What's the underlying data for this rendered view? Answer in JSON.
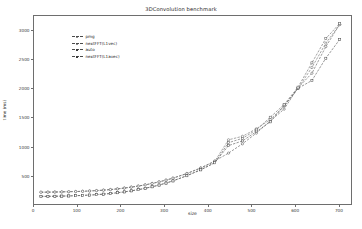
{
  "chart_data": {
    "type": "line",
    "title": "3DConvolution benchmark",
    "xlabel": "size",
    "ylabel": "time (ms)",
    "xlim": [
      0,
      730
    ],
    "ylim": [
      0,
      3250
    ],
    "xticks": [
      0,
      100,
      200,
      300,
      400,
      500,
      600,
      700
    ],
    "yticks": [
      500,
      1000,
      1500,
      2000,
      2500,
      3000
    ],
    "grid": false,
    "legend_position": "upper left",
    "x": [
      16,
      32,
      48,
      64,
      80,
      96,
      112,
      128,
      144,
      160,
      176,
      192,
      208,
      224,
      240,
      256,
      272,
      288,
      304,
      320,
      352,
      384,
      416,
      448,
      480,
      512,
      544,
      576,
      608,
      640,
      672,
      704
    ],
    "series": [
      {
        "name": "pmg",
        "marker": "circle",
        "linestyle": "dashed",
        "color": "#4a4a4a",
        "values": [
          205,
          206,
          208,
          210,
          213,
          216,
          220,
          226,
          232,
          240,
          250,
          262,
          276,
          292,
          310,
          332,
          356,
          384,
          414,
          448,
          528,
          625,
          742,
          880,
          1040,
          1225,
          1435,
          1640,
          2010,
          2260,
          2720,
          3105
        ]
      },
      {
        "name": "nextFFT(L1vec)",
        "marker": "circle",
        "linestyle": "dashed",
        "color": "#5a5a5a",
        "values": [
          203,
          204,
          206,
          209,
          212,
          215,
          219,
          225,
          231,
          239,
          249,
          261,
          275,
          291,
          309,
          330,
          354,
          382,
          412,
          446,
          525,
          620,
          736,
          1110,
          1170,
          1300,
          1460,
          1690,
          2000,
          2360,
          2780,
          3100
        ]
      },
      {
        "name": "auto",
        "marker": "square",
        "linestyle": "dashed",
        "color": "#3f3f3f",
        "values": [
          132,
          133,
          135,
          137,
          140,
          144,
          149,
          155,
          162,
          171,
          182,
          195,
          210,
          228,
          248,
          272,
          298,
          328,
          362,
          400,
          490,
          592,
          714,
          1010,
          1090,
          1250,
          1420,
          1700,
          2000,
          2135,
          2520,
          2845
        ]
      },
      {
        "name": "nextFFT(L1avec)",
        "marker": "square",
        "linestyle": "dashed",
        "color": "#545454",
        "values": [
          130,
          131,
          133,
          136,
          139,
          143,
          148,
          154,
          161,
          170,
          181,
          194,
          209,
          227,
          247,
          271,
          297,
          327,
          361,
          399,
          488,
          590,
          712,
          1060,
          1135,
          1280,
          1500,
          1720,
          2020,
          2440,
          2860,
          3120
        ]
      }
    ]
  },
  "figure": {
    "title": "3DConvolution benchmark",
    "xlabel": "size",
    "ylabel": "time (ms)"
  }
}
